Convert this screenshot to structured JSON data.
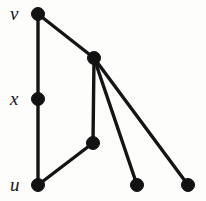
{
  "figure": {
    "background_color": "#fdfdfc",
    "vertex_color": "#121212",
    "edge_color": "#141414",
    "width": 206,
    "height": 201
  },
  "labels": {
    "v": "v",
    "x": "x",
    "u": "u"
  },
  "chart_data": {
    "type": "diagram",
    "subtype": "node-link-graph",
    "title": "",
    "directed": false,
    "vertex_radius": 6.5,
    "edge_width": 3.4,
    "nodes": [
      {
        "id": "v",
        "label": "v",
        "x": 38,
        "y": 14,
        "labeled": true,
        "label_pos": "left"
      },
      {
        "id": "h",
        "label": "",
        "x": 94,
        "y": 58,
        "labeled": false,
        "label_pos": ""
      },
      {
        "id": "x",
        "label": "x",
        "x": 38,
        "y": 99,
        "labeled": true,
        "label_pos": "left"
      },
      {
        "id": "m",
        "label": "",
        "x": 93,
        "y": 143,
        "labeled": false,
        "label_pos": ""
      },
      {
        "id": "u",
        "label": "u",
        "x": 38,
        "y": 185,
        "labeled": true,
        "label_pos": "left"
      },
      {
        "id": "b1",
        "label": "",
        "x": 137,
        "y": 185,
        "labeled": false,
        "label_pos": ""
      },
      {
        "id": "b2",
        "label": "",
        "x": 188,
        "y": 185,
        "labeled": false,
        "label_pos": ""
      }
    ],
    "edges": [
      {
        "source": "v",
        "target": "x"
      },
      {
        "source": "x",
        "target": "u"
      },
      {
        "source": "v",
        "target": "h"
      },
      {
        "source": "h",
        "target": "m"
      },
      {
        "source": "h",
        "target": "b1"
      },
      {
        "source": "h",
        "target": "b2"
      },
      {
        "source": "u",
        "target": "m"
      }
    ],
    "node_count": 7,
    "edge_count": 7
  }
}
